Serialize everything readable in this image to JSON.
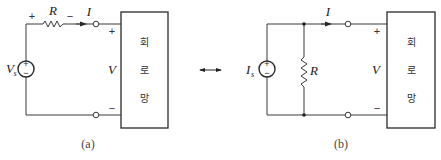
{
  "figure": {
    "double_arrow": "equivalence-arrow",
    "circuit_a": {
      "caption": "(a)",
      "source_label": "V",
      "source_subscript": "s",
      "source_type": "voltage-source",
      "source_plus": "+",
      "source_minus": "−",
      "resistor_label": "R",
      "resistor_plus": "+",
      "resistor_minus": "−",
      "current_label": "I",
      "voltage_label": "V",
      "terminal_plus": "+",
      "terminal_minus": "−",
      "network_text": [
        "회",
        "로",
        "망"
      ]
    },
    "circuit_b": {
      "caption": "(b)",
      "source_label": "I",
      "source_subscript": "s",
      "source_type": "current-source",
      "source_plus": "+",
      "source_minus": "−",
      "resistor_label": "R",
      "current_label": "I",
      "voltage_label": "V",
      "terminal_plus": "+",
      "terminal_minus": "−",
      "network_text": [
        "회",
        "로",
        "망"
      ]
    }
  }
}
